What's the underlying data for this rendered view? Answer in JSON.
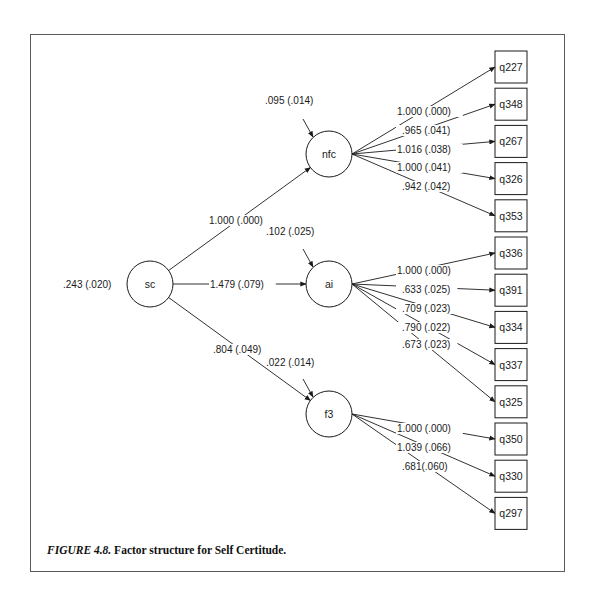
{
  "figure": {
    "caption_label": "FIGURE 4.8.",
    "caption_text": " Factor structure for Self Certitude."
  },
  "diagram": {
    "type": "structural-equation-model",
    "second_order_factor": {
      "id": "sc",
      "label": "sc",
      "variance_label": ".243 (.020)",
      "cx": 150,
      "cy": 284,
      "r": 23,
      "var_x": 63,
      "var_y": 288
    },
    "factors": [
      {
        "id": "nfc",
        "label": "nfc",
        "cx": 329,
        "cy": 154,
        "r": 23,
        "path_label": "1.000 (.000)",
        "path_label_x": 209,
        "path_label_y": 224,
        "disturbance_label": ".095 (.014)",
        "dist_label_x": 265,
        "dist_label_y": 104,
        "indicators": [
          "q227",
          "q348",
          "q267",
          "q326",
          "q353"
        ],
        "loadings": [
          "1.000 (.000)",
          ".965 (.041)",
          "1.016 (.038)",
          "1.000 (.041)",
          ".942 (.042)"
        ],
        "load_label_y": [
          115,
          134,
          153,
          171,
          190
        ]
      },
      {
        "id": "ai",
        "label": "ai",
        "cx": 329,
        "cy": 284,
        "r": 23,
        "path_label": "1.479 (.079)",
        "path_label_x": 210,
        "path_label_y": 288,
        "disturbance_label": ".102 (.025)",
        "dist_label_x": 266,
        "dist_label_y": 235,
        "indicators": [
          "q336",
          "q391",
          "q334",
          "q337",
          "q325"
        ],
        "loadings": [
          "1.000 (.000)",
          ".633 (.025)",
          ".709 (.023)",
          ".790 (.022)",
          ".673 (.023)"
        ],
        "load_label_y": [
          274,
          293,
          312,
          331,
          348
        ]
      },
      {
        "id": "f3",
        "label": "f3",
        "cx": 329,
        "cy": 414,
        "r": 23,
        "path_label": ".804 (.049)",
        "path_label_x": 213,
        "path_label_y": 353,
        "disturbance_label": ".022 (.014)",
        "dist_label_x": 266,
        "dist_label_y": 366,
        "indicators": [
          "q350",
          "q330",
          "q297"
        ],
        "loadings": [
          "1.000 (.000)",
          "1.039 (.066)",
          ".681(.060)"
        ],
        "load_label_y": [
          432,
          451,
          470
        ]
      }
    ],
    "indicator_box": {
      "x": 495,
      "y0": 51,
      "w": 32,
      "h": 32,
      "pitch": 37.2
    },
    "load_label_x": 397
  }
}
